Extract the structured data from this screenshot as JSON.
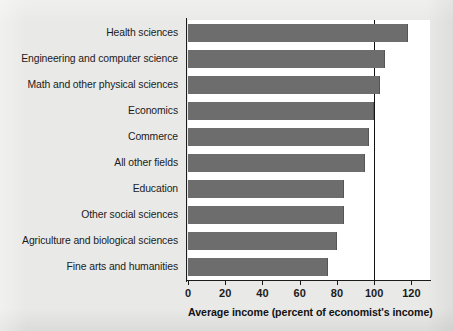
{
  "chart_data": {
    "type": "bar",
    "orientation": "horizontal",
    "title": "",
    "xlabel": "Average income (percent of economist's income)",
    "ylabel": "",
    "categories": [
      "Health sciences",
      "Engineering and computer science",
      "Math and other physical sciences",
      "Economics",
      "Commerce",
      "All other fields",
      "Education",
      "Other social sciences",
      "Agriculture and biological sciences",
      "Fine arts and humanities"
    ],
    "values": [
      118,
      106,
      103,
      100,
      97,
      95,
      84,
      84,
      80,
      75
    ],
    "xlim": [
      0,
      130
    ],
    "xticks": [
      0,
      20,
      40,
      60,
      80,
      100,
      120
    ],
    "xtick_labels": [
      "0",
      "20",
      "40",
      "60",
      "80",
      "100",
      "120"
    ],
    "grid": false,
    "legend": false,
    "reference_line": {
      "value": 100,
      "orientation": "vertical",
      "color": "#111111"
    },
    "colors": {
      "bar": "#6d6d6d",
      "plot_background": "#ffffff",
      "page_background": "#e9e9e7",
      "axis": "#1b1b1b",
      "text": "#1b1b1b"
    }
  }
}
